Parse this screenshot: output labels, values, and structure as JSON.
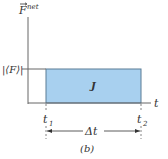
{
  "figure": {
    "panel_label": "(b)",
    "y_axis_label": "F",
    "y_axis_superscript": "net",
    "x_axis_label": "t",
    "avg_force_label": "|⟨F⟩|",
    "t1_label": "t",
    "t1_sub": "1",
    "t2_label": "t",
    "t2_sub": "2",
    "delta_t_label": "Δt",
    "area_label": "J",
    "colors": {
      "area_fill": "#a8d0ef",
      "area_stroke": "#5a7d95",
      "axis": "#666666",
      "text": "#333333"
    }
  }
}
